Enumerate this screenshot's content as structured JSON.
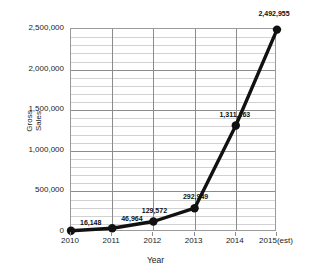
{
  "chart_data": {
    "type": "line",
    "title": "",
    "subtitle": "",
    "xlabel": "Year",
    "ylabel": "Gross\nSales",
    "ylabel_line1": "Gross",
    "ylabel_line2": "Sales",
    "categories": [
      "2010",
      "2011",
      "2012",
      "2013",
      "2014",
      "2015(est)"
    ],
    "values": [
      16148,
      46964,
      129572,
      292949,
      1311263,
      2492955
    ],
    "point_labels": [
      "16,148",
      "46,964",
      "129,572",
      "292,949",
      "1,311,263",
      "2,492,955"
    ],
    "ylim": [
      0,
      2500000
    ],
    "ytick_values": [
      0,
      500000,
      1000000,
      1500000,
      2000000,
      2500000
    ],
    "ytick_labels": [
      "0",
      "500,000",
      "1,000,000",
      "1,500,000",
      "2,000,000",
      "2,500,000"
    ],
    "minor_tick_step": 100000,
    "grid": true,
    "grid_minor": true,
    "legend": false,
    "legend_position": "none",
    "series": [
      {
        "name": "Gross Sales",
        "color": "#111111",
        "marker": "circle",
        "values": [
          16148,
          46964,
          129572,
          292949,
          1311263,
          2492955
        ]
      }
    ],
    "colors": {
      "line": "#111111",
      "marker": "#111111",
      "grid_major": "#8c8c8c",
      "grid_minor": "#d2d2d2",
      "axis": "#9a9a9a",
      "text": "#1a1a1a",
      "background": "#ffffff"
    }
  }
}
